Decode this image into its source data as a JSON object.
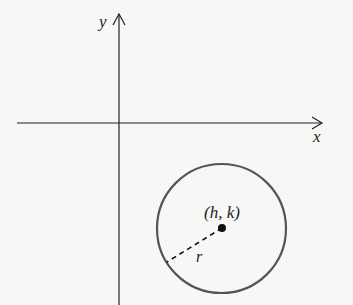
{
  "diagram": {
    "axes": {
      "x_label": "x",
      "y_label": "y"
    },
    "circle": {
      "center_label": "(h, k)",
      "radius_label": "r",
      "stroke_color": "#555555"
    },
    "colors": {
      "background": "#f7f7f5",
      "axis": "#222222",
      "point": "#111111"
    }
  }
}
